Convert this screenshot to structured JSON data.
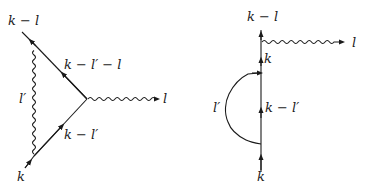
{
  "diagrams": [
    {
      "name": "vertex-correction",
      "labels": {
        "incoming": "k",
        "outgoing": "k − l",
        "lower_internal": "k − l′",
        "upper_internal": "k − l′ − l",
        "loop_photon": "l′",
        "external_photon": "l"
      }
    },
    {
      "name": "self-energy-insertion",
      "labels": {
        "incoming": "k",
        "outgoing": "k − l",
        "internal_loop": "k − l′",
        "after_loop": "k",
        "loop_photon": "l′",
        "external_photon": "l"
      }
    }
  ],
  "colors": {
    "line": "#1a1a1a",
    "background": "#ffffff"
  }
}
